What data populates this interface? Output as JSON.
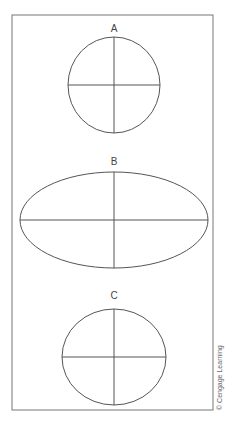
{
  "figure": {
    "shapes": [
      {
        "label": "A",
        "cx": 114,
        "cy": 85,
        "rx": 46,
        "ry": 48,
        "label_y": 32
      },
      {
        "label": "B",
        "cx": 114,
        "cy": 220,
        "rx": 94,
        "ry": 48,
        "label_y": 165
      },
      {
        "label": "C",
        "cx": 114,
        "cy": 357,
        "rx": 52,
        "ry": 48,
        "label_y": 299
      }
    ],
    "copyright": "© Cengage Learning",
    "colors": {
      "stroke": "#555555",
      "frame": "#777777",
      "text": "#444444"
    }
  }
}
